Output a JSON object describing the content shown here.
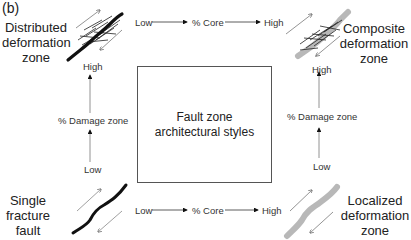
{
  "panel_label": "(b)",
  "center_box": {
    "line1": "Fault zone",
    "line2": "architectural styles"
  },
  "corners": {
    "top_left": {
      "line1": "Distributed",
      "line2": "deformation",
      "line3": "zone",
      "fault_style": "black-core-with-many-fractures"
    },
    "top_right": {
      "line1": "Composite",
      "line2": "deformation",
      "line3": "zone",
      "fault_style": "gray-core-with-many-fractures"
    },
    "bottom_left": {
      "line1": "Single",
      "line2": "fracture",
      "line3": "fault",
      "fault_style": "black-single-line"
    },
    "bottom_right": {
      "line1": "Localized",
      "line2": "deformation",
      "line3": "zone",
      "fault_style": "gray-single-band"
    }
  },
  "axes": {
    "top": {
      "low": "Low",
      "label": "% Core",
      "high": "High"
    },
    "bottom": {
      "low": "Low",
      "label": "% Core",
      "high": "High"
    },
    "left": {
      "low": "Low",
      "label": "% Damage zone",
      "high": "High"
    },
    "right": {
      "low": "Low",
      "label": "% Damage zone",
      "high": "High"
    }
  },
  "colors": {
    "core_black": "#111111",
    "core_gray": "#b8b8b8",
    "arrow": "#222222",
    "slip_arrow": "#777777"
  }
}
